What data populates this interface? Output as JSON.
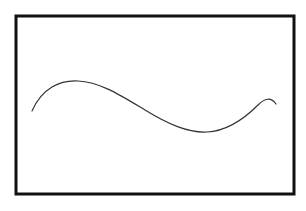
{
  "figure": {
    "background": "#ffffff",
    "frame": {
      "x": 16,
      "y": 16,
      "width": 278,
      "height": 178,
      "stroke": "#111111",
      "stroke_width": 3
    },
    "curve": {
      "stroke": "#333333",
      "stroke_width": 1.2,
      "path": "M 32 111 C 42 88, 60 80, 78 81 C 100 82, 120 95, 145 110 C 168 124, 188 133, 207 132 C 228 131, 245 118, 258 105 C 265 98, 271 97, 276 104"
    }
  }
}
